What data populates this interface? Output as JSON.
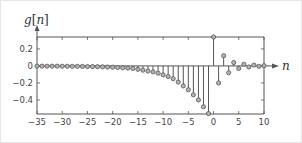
{
  "chart_data": {
    "type": "stem",
    "title": "",
    "xlabel": "n",
    "ylabel": "g[n]",
    "xlim": [
      -35,
      10
    ],
    "ylim": [
      -0.565,
      0.34
    ],
    "xticks": [
      -35,
      -30,
      -25,
      -20,
      -15,
      -10,
      -5,
      0,
      5,
      10
    ],
    "xtick_labels": [
      "−35",
      "−30",
      "−25",
      "−20",
      "−15",
      "−10",
      "−5",
      "0",
      "5",
      "10"
    ],
    "yticks": [
      0.2,
      0,
      -0.2,
      -0.4
    ],
    "ytick_labels": [
      "0.2",
      "0",
      "−0.2",
      "−0.4"
    ],
    "grid": false,
    "legend": null,
    "x": [
      -35,
      -34,
      -33,
      -32,
      -31,
      -30,
      -29,
      -28,
      -27,
      -26,
      -25,
      -24,
      -23,
      -22,
      -21,
      -20,
      -19,
      -18,
      -17,
      -16,
      -15,
      -14,
      -13,
      -12,
      -11,
      -10,
      -9,
      -8,
      -7,
      -6,
      -5,
      -4,
      -3,
      -2,
      -1,
      0,
      1,
      2,
      3,
      4,
      5,
      6,
      7,
      8,
      9,
      10
    ],
    "values": [
      -0.002,
      -0.002,
      -0.003,
      -0.003,
      -0.003,
      -0.004,
      -0.004,
      -0.005,
      -0.005,
      -0.006,
      -0.007,
      -0.008,
      -0.009,
      -0.011,
      -0.013,
      -0.015,
      -0.018,
      -0.021,
      -0.025,
      -0.03,
      -0.04,
      -0.05,
      -0.06,
      -0.07,
      -0.085,
      -0.105,
      -0.125,
      -0.15,
      -0.19,
      -0.235,
      -0.28,
      -0.34,
      -0.4,
      -0.48,
      -0.56,
      0.34,
      -0.2,
      0.12,
      -0.08,
      0.04,
      -0.03,
      0.02,
      -0.012,
      0.01,
      -0.005,
      0.003
    ]
  },
  "labels": {
    "y_axis": "g[n]",
    "x_axis": "n"
  },
  "style": {
    "stem_color": "#555555",
    "marker_fill": "#b3b3b3",
    "marker_stroke": "#555555",
    "axis_color": "#555555"
  }
}
